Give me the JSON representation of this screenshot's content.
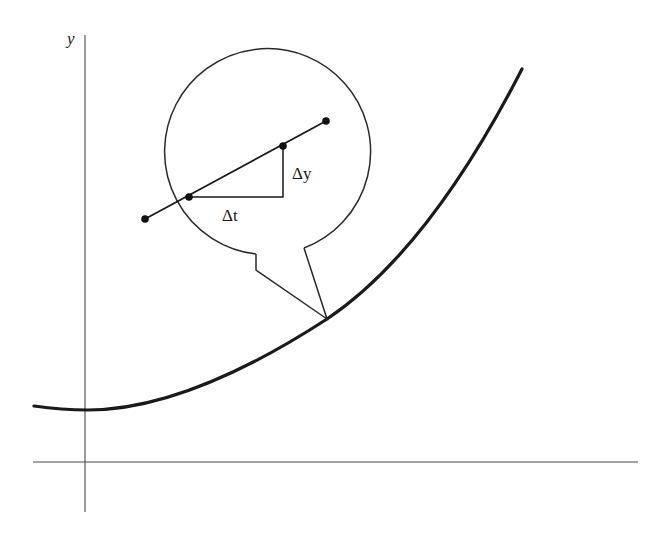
{
  "figure": {
    "type": "magnified-secant-diagram",
    "axes": {
      "y_label": "y"
    },
    "magnifier": {
      "delta_x_label": "Δt",
      "delta_y_label": "Δy",
      "points_on_secant": 4
    },
    "colors": {
      "ink": "#1a1a1a",
      "axis": "#4a4a4a",
      "background": "#ffffff"
    }
  }
}
